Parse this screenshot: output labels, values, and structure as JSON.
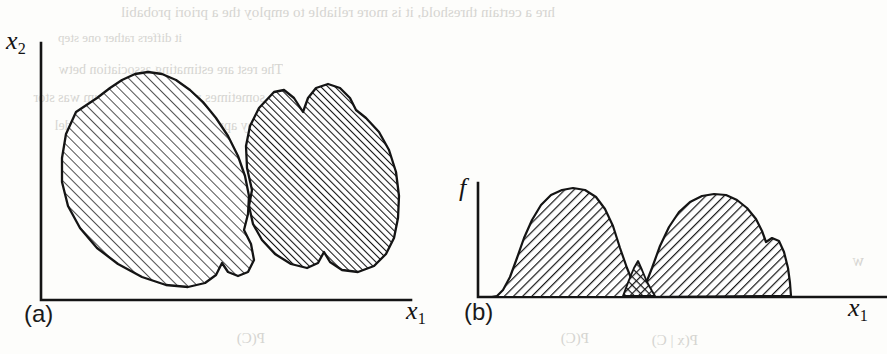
{
  "figure": {
    "kind": "scanned-textbook-figure",
    "background_color": "#fdfdfb",
    "ink_color": "#141414",
    "panels": [
      {
        "id": "a",
        "label": "(a)",
        "x_axis_label": "x",
        "x_axis_subscript": "1",
        "y_axis_label": "x",
        "y_axis_subscript": "2",
        "description": "Two overlapping hatched class regions in a two dimensional feature space"
      },
      {
        "id": "b",
        "label": "(b)",
        "x_axis_label": "x",
        "x_axis_subscript": "1",
        "y_axis_label": "f",
        "y_axis_subscript": "",
        "description": "Two class conditional density curves along x1 with a cross hatched overlap region"
      }
    ],
    "ghost_text": [
      {
        "text": "hre a certain threshold, it is more reliable to employ the a priori probabil",
        "x": 8,
        "y": 4,
        "size": 15
      },
      {
        "text": "it differs rather one step",
        "x": 20,
        "y": 30,
        "size": 13
      },
      {
        "text": "The rest are estimating association betw",
        "x": 14,
        "y": 62,
        "size": 14
      },
      {
        "text": "sometimes require the minimum was stor",
        "x": 10,
        "y": 90,
        "size": 14
      },
      {
        "text": "achieved by applying Bayes' rule for a model",
        "x": 12,
        "y": 118,
        "size": 14
      },
      {
        "text": "p d",
        "x": 198,
        "y": 196,
        "size": 14
      },
      {
        "text": "P(C)",
        "x": 236,
        "y": 330,
        "size": 15
      },
      {
        "text": "P(C)",
        "x": 560,
        "y": 330,
        "size": 15
      },
      {
        "text": "P(x | C)",
        "x": 640,
        "y": 332,
        "size": 15
      },
      {
        "text": "P(x)",
        "x": 560,
        "y": 214,
        "size": 15
      },
      {
        "text": "w",
        "x": 856,
        "y": 252,
        "size": 16
      }
    ]
  },
  "chart_data": [
    {
      "type": "area",
      "panel": "a",
      "title": "",
      "xlabel": "x1",
      "ylabel": "x2",
      "grid": false,
      "legend": "none",
      "xlim": [
        0,
        100
      ],
      "ylim": [
        0,
        100
      ],
      "series": [
        {
          "name": "class-1-region",
          "hatch": "forward-diagonal-light",
          "hatch_angle_deg": 45,
          "polygon": [
            [
              12,
              62
            ],
            [
              16,
              74
            ],
            [
              26,
              84
            ],
            [
              37,
              90
            ],
            [
              44,
              86
            ],
            [
              47,
              92
            ],
            [
              53,
              95
            ],
            [
              62,
              92
            ],
            [
              66,
              84
            ],
            [
              68,
              70
            ],
            [
              66,
              56
            ],
            [
              63,
              44
            ],
            [
              58,
              32
            ],
            [
              50,
              20
            ],
            [
              42,
              12
            ],
            [
              33,
              8
            ],
            [
              24,
              10
            ],
            [
              16,
              18
            ],
            [
              11,
              30
            ],
            [
              9,
              46
            ]
          ]
        },
        {
          "name": "class-2-region",
          "hatch": "forward-diagonal-dense",
          "hatch_angle_deg": 45,
          "polygon": [
            [
              66,
              66
            ],
            [
              68,
              80
            ],
            [
              72,
              90
            ],
            [
              79,
              93
            ],
            [
              83,
              88
            ],
            [
              86,
              93
            ],
            [
              92,
              95
            ],
            [
              97,
              90
            ],
            [
              99,
              78
            ],
            [
              99,
              60
            ],
            [
              97,
              46
            ],
            [
              93,
              36
            ],
            [
              87,
              30
            ],
            [
              84,
              22
            ],
            [
              78,
              17
            ],
            [
              72,
              20
            ],
            [
              69,
              30
            ],
            [
              67,
              44
            ],
            [
              65,
              56
            ]
          ]
        }
      ]
    },
    {
      "type": "area",
      "panel": "b",
      "title": "",
      "xlabel": "x1",
      "ylabel": "f",
      "grid": false,
      "legend": "none",
      "xlim": [
        0,
        100
      ],
      "ylim": [
        0,
        100
      ],
      "series": [
        {
          "name": "density-class-1",
          "hatch": "back-diagonal",
          "hatch_angle_deg": 135,
          "x": [
            3,
            6,
            9,
            12,
            15,
            18,
            22,
            26,
            30,
            34,
            38,
            42,
            45,
            47,
            49
          ],
          "y": [
            0,
            3,
            12,
            30,
            52,
            66,
            78,
            88,
            94,
            95,
            90,
            76,
            52,
            26,
            0
          ]
        },
        {
          "name": "density-class-2",
          "hatch": "back-diagonal",
          "hatch_angle_deg": 135,
          "x": [
            44,
            46,
            49,
            52,
            56,
            60,
            64,
            68,
            72,
            76,
            80,
            84,
            88,
            90
          ],
          "y": [
            0,
            18,
            46,
            66,
            76,
            82,
            84,
            85,
            82,
            74,
            62,
            46,
            28,
            0
          ]
        },
        {
          "name": "overlap-region",
          "hatch": "cross-hatch-dotted",
          "x": [
            44,
            46,
            47,
            48,
            49
          ],
          "y": [
            0,
            14,
            20,
            12,
            0
          ]
        }
      ]
    }
  ]
}
